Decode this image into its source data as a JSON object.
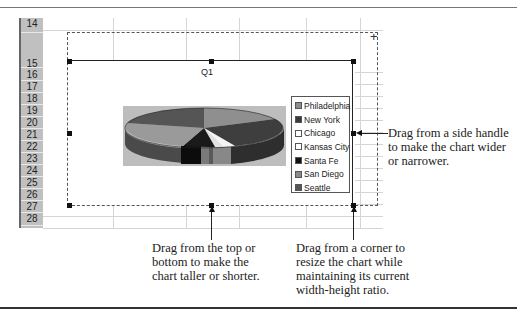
{
  "spreadsheet": {
    "rows": [
      "14",
      "15",
      "16",
      "17",
      "18",
      "19",
      "20",
      "21",
      "22",
      "23",
      "24",
      "25",
      "26",
      "27",
      "28"
    ]
  },
  "chart": {
    "title": "Q1",
    "legend": [
      {
        "label": "Philadelphia",
        "color": "#8c8c8c"
      },
      {
        "label": "New York",
        "color": "#3a3a3a"
      },
      {
        "label": "Chicago",
        "color": "#ffffff"
      },
      {
        "label": "Kansas City",
        "color": "#ffffff"
      },
      {
        "label": "Santa Fe",
        "color": "#111111"
      },
      {
        "label": "San Diego",
        "color": "#8a8a8a"
      },
      {
        "label": "Seattle",
        "color": "#555555"
      }
    ]
  },
  "callouts": {
    "side": [
      "Drag from a side handle",
      "to make the chart wider",
      "or narrower."
    ],
    "top_bottom": [
      "Drag from the top or",
      "bottom to make the",
      "chart taller or shorter."
    ],
    "corner": [
      "Drag from a corner to",
      "resize the chart while",
      "maintaining its current",
      "width-height ratio."
    ]
  }
}
